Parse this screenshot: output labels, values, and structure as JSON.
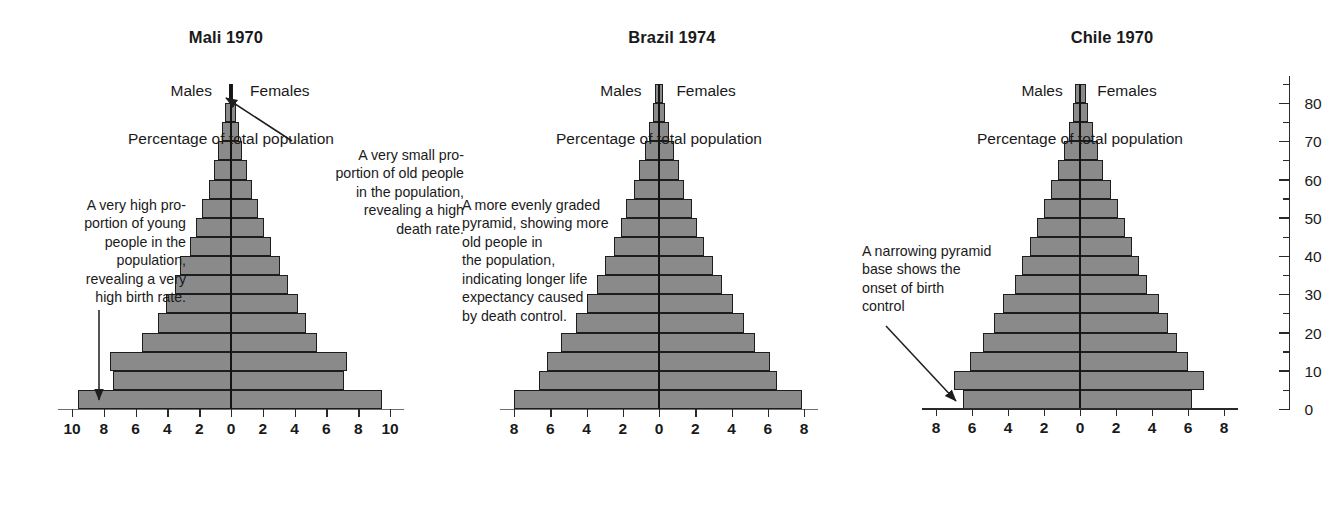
{
  "figure": {
    "axis_title": "Percentage of total population",
    "males_label": "Males",
    "females_label": "Females",
    "bar_color": "#8a8a8a",
    "outline_color": "#1d1d1d"
  },
  "chart_data": [
    {
      "type": "bar",
      "subtype": "population-pyramid",
      "title": "Mali 1970",
      "xlabel": "Percentage of total population",
      "ylabel": "Age",
      "xlim": [
        -10,
        10
      ],
      "xtick_labels": [
        "10",
        "8",
        "6",
        "4",
        "2",
        "0",
        "2",
        "4",
        "6",
        "8",
        "10"
      ],
      "xtick_values": [
        -10,
        -8,
        -6,
        -4,
        -2,
        0,
        2,
        4,
        6,
        8,
        10
      ],
      "grid": false,
      "age_groups": [
        "0-4",
        "5-9",
        "10-14",
        "15-19",
        "20-24",
        "25-29",
        "30-34",
        "35-39",
        "40-44",
        "45-49",
        "50-54",
        "55-59",
        "60-64",
        "65-69",
        "70-74",
        "75-79",
        "80+"
      ],
      "series": [
        {
          "name": "Males",
          "values": [
            9.6,
            7.4,
            7.6,
            5.6,
            4.6,
            4.1,
            3.5,
            3.2,
            2.6,
            2.2,
            1.8,
            1.4,
            1.1,
            0.8,
            0.55,
            0.35,
            0.15
          ]
        },
        {
          "name": "Females",
          "values": [
            9.5,
            7.1,
            7.3,
            5.4,
            4.7,
            4.2,
            3.6,
            3.1,
            2.5,
            2.1,
            1.7,
            1.3,
            1.0,
            0.7,
            0.5,
            0.3,
            0.15
          ]
        }
      ],
      "annotations": [
        {
          "id": "young",
          "text": "A very high pro-\nportion of young\npeople in the\npopulation,\nrevealing a very\nhigh birth rate.",
          "align": "right"
        },
        {
          "id": "old",
          "text": "A very small pro-\nportion of old people\nin the population,\nrevealing a high\ndeath rate.",
          "align": "right"
        }
      ]
    },
    {
      "type": "bar",
      "subtype": "population-pyramid",
      "title": "Brazil 1974",
      "xlabel": "Percentage of total population",
      "ylabel": "Age",
      "xlim": [
        -8,
        8
      ],
      "xtick_labels": [
        "8",
        "6",
        "4",
        "2",
        "0",
        "2",
        "4",
        "6",
        "8"
      ],
      "xtick_values": [
        -8,
        -6,
        -4,
        -2,
        0,
        2,
        4,
        6,
        8
      ],
      "grid": false,
      "age_groups": [
        "0-4",
        "5-9",
        "10-14",
        "15-19",
        "20-24",
        "25-29",
        "30-34",
        "35-39",
        "40-44",
        "45-49",
        "50-54",
        "55-59",
        "60-64",
        "65-69",
        "70-74",
        "75-79",
        "80+"
      ],
      "series": [
        {
          "name": "Males",
          "values": [
            8.0,
            6.6,
            6.2,
            5.4,
            4.6,
            4.0,
            3.4,
            3.0,
            2.5,
            2.1,
            1.8,
            1.4,
            1.1,
            0.8,
            0.55,
            0.35,
            0.2
          ]
        },
        {
          "name": "Females",
          "values": [
            7.9,
            6.5,
            6.1,
            5.3,
            4.7,
            4.1,
            3.5,
            3.0,
            2.5,
            2.1,
            1.8,
            1.4,
            1.1,
            0.8,
            0.55,
            0.35,
            0.2
          ]
        }
      ],
      "annotations": [
        {
          "id": "graded",
          "text": "A more evenly graded\npyramid, showing more\nold people in\nthe population,\nindicating longer life\nexpectancy caused\nby death control.",
          "align": "left"
        }
      ]
    },
    {
      "type": "bar",
      "subtype": "population-pyramid",
      "title": "Chile 1970",
      "xlabel": "Percentage of total population",
      "ylabel": "Age",
      "xlim": [
        -8,
        8
      ],
      "xtick_labels": [
        "8",
        "6",
        "4",
        "2",
        "0",
        "2",
        "4",
        "6",
        "8"
      ],
      "xtick_values": [
        -8,
        -6,
        -4,
        -2,
        0,
        2,
        4,
        6,
        8
      ],
      "ytick_labels": [
        "0",
        "10",
        "20",
        "30",
        "40",
        "50",
        "60",
        "70",
        "80"
      ],
      "ytick_values": [
        0,
        10,
        20,
        30,
        40,
        50,
        60,
        70,
        80
      ],
      "grid": false,
      "age_groups": [
        "0-4",
        "5-9",
        "10-14",
        "15-19",
        "20-24",
        "25-29",
        "30-34",
        "35-39",
        "40-44",
        "45-49",
        "50-54",
        "55-59",
        "60-64",
        "65-69",
        "70-74",
        "75-79",
        "80+"
      ],
      "series": [
        {
          "name": "Males",
          "values": [
            6.5,
            7.0,
            6.1,
            5.4,
            4.8,
            4.3,
            3.6,
            3.2,
            2.8,
            2.4,
            2.0,
            1.6,
            1.2,
            0.9,
            0.6,
            0.4,
            0.3
          ]
        },
        {
          "name": "Females",
          "values": [
            6.2,
            6.9,
            6.0,
            5.4,
            4.9,
            4.4,
            3.7,
            3.3,
            2.9,
            2.5,
            2.1,
            1.7,
            1.3,
            1.0,
            0.7,
            0.45,
            0.35
          ]
        }
      ],
      "annotations": [
        {
          "id": "narrowing",
          "text": "A narrowing pyramid\nbase shows the\nonset of birth\ncontrol",
          "align": "left"
        }
      ]
    }
  ]
}
